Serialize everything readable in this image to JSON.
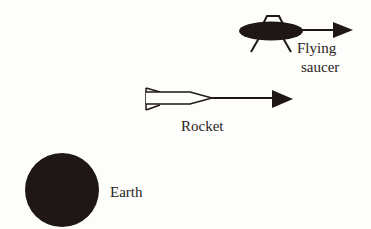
{
  "diagram": {
    "colors": {
      "ink": "#1e1715",
      "background": "#fdfdfb",
      "text": "#2a2422"
    },
    "objects": [
      {
        "id": "flying-saucer",
        "label_lines": [
          "Flying",
          "saucer"
        ],
        "has_velocity_arrow": true,
        "arrow_direction": "right"
      },
      {
        "id": "rocket",
        "label": "Rocket",
        "has_velocity_arrow": true,
        "arrow_direction": "right"
      },
      {
        "id": "earth",
        "label": "Earth",
        "has_velocity_arrow": false
      }
    ]
  },
  "labels": {
    "saucer_line1": "Flying",
    "saucer_line2": "saucer",
    "rocket": "Rocket",
    "earth": "Earth"
  }
}
